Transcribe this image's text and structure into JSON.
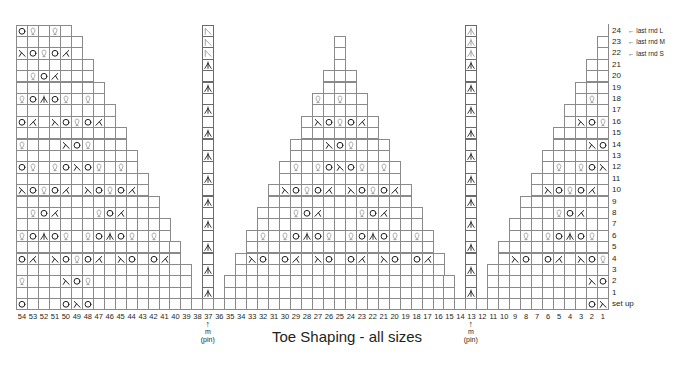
{
  "title": "Toe Shaping - all sizes",
  "colors": {
    "grid": "#8a8a8a",
    "ink": "#231f20",
    "ghost": "#9a9a9a"
  },
  "columns": [
    54,
    53,
    52,
    51,
    50,
    49,
    48,
    47,
    46,
    45,
    44,
    43,
    42,
    41,
    40,
    39,
    38,
    37,
    36,
    35,
    34,
    33,
    32,
    31,
    30,
    29,
    28,
    27,
    26,
    25,
    24,
    23,
    22,
    21,
    20,
    19,
    18,
    17,
    16,
    15,
    14,
    13,
    12,
    11,
    10,
    9,
    8,
    7,
    6,
    5,
    4,
    3,
    2,
    1
  ],
  "rows": [
    "24",
    "23",
    "22",
    "21",
    "20",
    "19",
    "18",
    "17",
    "16",
    "15",
    "14",
    "13",
    "12",
    "11",
    "10",
    "9",
    "8",
    "7",
    "6",
    "5",
    "4",
    "3",
    "2",
    "1",
    "set up"
  ],
  "row_notes": [
    {
      "row": "24",
      "text": "last rnd L"
    },
    {
      "row": "23",
      "text": "last rnd M"
    },
    {
      "row": "22",
      "text": "last rnd S"
    }
  ],
  "markers": [
    {
      "column": 37,
      "symbol": "↑",
      "line1": "m",
      "line2": "(pin)"
    },
    {
      "column": 13,
      "symbol": "↑",
      "line1": "m",
      "line2": "(pin)"
    }
  ],
  "legend_symbols": {
    "O": "yarn-over",
    "Q": "twisted-loop (make one)",
    "L": "left-slanting decrease",
    "R": "right-slanting decrease",
    "A": "centered double decrease",
    "G": "centered double decrease (last round, ghosted)",
    "K": "left-slanting decrease (last round, ghosted)"
  },
  "shape": {
    "24": [
      [
        54,
        50
      ],
      [
        37,
        37
      ],
      [
        13,
        13
      ]
    ],
    "23": [
      [
        54,
        49
      ],
      [
        37,
        37
      ],
      [
        25,
        25
      ],
      [
        13,
        13
      ],
      [
        1,
        1
      ]
    ],
    "22": [
      [
        54,
        49
      ],
      [
        37,
        37
      ],
      [
        25,
        25
      ],
      [
        13,
        13
      ],
      [
        1,
        1
      ]
    ],
    "21": [
      [
        54,
        48
      ],
      [
        37,
        37
      ],
      [
        25,
        25
      ],
      [
        13,
        13
      ],
      [
        2,
        1
      ]
    ],
    "20": [
      [
        54,
        48
      ],
      [
        37,
        37
      ],
      [
        26,
        24
      ],
      [
        13,
        13
      ],
      [
        2,
        1
      ]
    ],
    "19": [
      [
        54,
        47
      ],
      [
        37,
        37
      ],
      [
        26,
        24
      ],
      [
        13,
        13
      ],
      [
        3,
        1
      ]
    ],
    "18": [
      [
        54,
        47
      ],
      [
        37,
        37
      ],
      [
        27,
        23
      ],
      [
        13,
        13
      ],
      [
        3,
        1
      ]
    ],
    "17": [
      [
        54,
        46
      ],
      [
        37,
        37
      ],
      [
        27,
        23
      ],
      [
        13,
        13
      ],
      [
        4,
        1
      ]
    ],
    "16": [
      [
        54,
        46
      ],
      [
        37,
        37
      ],
      [
        28,
        22
      ],
      [
        13,
        13
      ],
      [
        4,
        1
      ]
    ],
    "15": [
      [
        54,
        45
      ],
      [
        37,
        37
      ],
      [
        28,
        22
      ],
      [
        13,
        13
      ],
      [
        5,
        1
      ]
    ],
    "14": [
      [
        54,
        45
      ],
      [
        37,
        37
      ],
      [
        29,
        21
      ],
      [
        13,
        13
      ],
      [
        5,
        1
      ]
    ],
    "13": [
      [
        54,
        44
      ],
      [
        37,
        37
      ],
      [
        29,
        21
      ],
      [
        13,
        13
      ],
      [
        6,
        1
      ]
    ],
    "12": [
      [
        54,
        44
      ],
      [
        37,
        37
      ],
      [
        30,
        20
      ],
      [
        13,
        13
      ],
      [
        6,
        1
      ]
    ],
    "11": [
      [
        54,
        43
      ],
      [
        37,
        37
      ],
      [
        30,
        20
      ],
      [
        13,
        13
      ],
      [
        7,
        1
      ]
    ],
    "10": [
      [
        54,
        43
      ],
      [
        37,
        37
      ],
      [
        31,
        19
      ],
      [
        13,
        13
      ],
      [
        7,
        1
      ]
    ],
    "9": [
      [
        54,
        42
      ],
      [
        37,
        37
      ],
      [
        31,
        19
      ],
      [
        13,
        13
      ],
      [
        8,
        1
      ]
    ],
    "8": [
      [
        54,
        42
      ],
      [
        37,
        37
      ],
      [
        32,
        18
      ],
      [
        13,
        13
      ],
      [
        8,
        1
      ]
    ],
    "7": [
      [
        54,
        41
      ],
      [
        37,
        37
      ],
      [
        32,
        18
      ],
      [
        13,
        13
      ],
      [
        9,
        1
      ]
    ],
    "6": [
      [
        54,
        41
      ],
      [
        37,
        37
      ],
      [
        33,
        17
      ],
      [
        13,
        13
      ],
      [
        9,
        1
      ]
    ],
    "5": [
      [
        54,
        40
      ],
      [
        37,
        37
      ],
      [
        33,
        17
      ],
      [
        13,
        13
      ],
      [
        10,
        1
      ]
    ],
    "4": [
      [
        54,
        40
      ],
      [
        37,
        37
      ],
      [
        34,
        16
      ],
      [
        13,
        13
      ],
      [
        10,
        1
      ]
    ],
    "3": [
      [
        54,
        39
      ],
      [
        37,
        37
      ],
      [
        34,
        16
      ],
      [
        13,
        13
      ],
      [
        11,
        1
      ]
    ],
    "2": [
      [
        54,
        39
      ],
      [
        37,
        37
      ],
      [
        35,
        15
      ],
      [
        13,
        13
      ],
      [
        11,
        1
      ]
    ],
    "1": [
      [
        54,
        39
      ],
      [
        37,
        37
      ],
      [
        35,
        15
      ],
      [
        13,
        13
      ],
      [
        11,
        1
      ]
    ],
    "set up": [
      [
        54,
        1
      ]
    ]
  },
  "symbols": {
    "24": {
      "54": "O",
      "53": "Q",
      "51": "Q",
      "37": "K",
      "13": "G"
    },
    "23": {
      "37": "K",
      "13": "G"
    },
    "22": {
      "54": "R",
      "53": "O",
      "52": "Q",
      "51": "O",
      "50": "L",
      "37": "K",
      "13": "G"
    },
    "21": {
      "37": "A",
      "13": "A"
    },
    "20": {
      "53": "Q",
      "52": "O",
      "51": "L"
    },
    "19": {
      "37": "A",
      "13": "A"
    },
    "18": {
      "54": "Q",
      "53": "O",
      "52": "A",
      "51": "O",
      "50": "Q",
      "48": "Q",
      "27": "Q",
      "25": "Q",
      "2": "Q"
    },
    "17": {
      "37": "A",
      "13": "A"
    },
    "16": {
      "54": "O",
      "53": "L",
      "51": "R",
      "50": "O",
      "49": "Q",
      "48": "O",
      "47": "L",
      "27": "R",
      "26": "O",
      "25": "Q",
      "24": "O",
      "23": "L",
      "3": "R",
      "2": "O",
      "1": "Q"
    },
    "15": {
      "37": "A",
      "13": "A"
    },
    "14": {
      "54": "Q",
      "50": "R",
      "49": "O",
      "48": "Q",
      "26": "R",
      "25": "O",
      "24": "Q",
      "2": "R",
      "1": "O"
    },
    "13": {
      "37": "A",
      "13": "A"
    },
    "12": {
      "54": "O",
      "53": "Q",
      "51": "Q",
      "50": "O",
      "49": "R",
      "48": "O",
      "47": "Q",
      "45": "Q",
      "29": "Q",
      "27": "Q",
      "26": "O",
      "25": "R",
      "24": "O",
      "23": "Q",
      "21": "Q",
      "5": "Q",
      "3": "Q",
      "2": "O",
      "1": "R"
    },
    "11": {
      "37": "A",
      "13": "A"
    },
    "10": {
      "54": "R",
      "53": "O",
      "52": "Q",
      "51": "O",
      "50": "L",
      "48": "R",
      "47": "O",
      "46": "Q",
      "45": "O",
      "44": "L",
      "30": "R",
      "29": "O",
      "28": "Q",
      "27": "O",
      "26": "L",
      "24": "R",
      "23": "O",
      "22": "Q",
      "21": "O",
      "20": "L",
      "6": "R",
      "5": "O",
      "4": "Q",
      "3": "O",
      "2": "L"
    },
    "9": {
      "37": "A",
      "13": "A"
    },
    "8": {
      "53": "Q",
      "52": "O",
      "51": "L",
      "47": "Q",
      "46": "O",
      "45": "L",
      "29": "Q",
      "28": "O",
      "27": "L",
      "23": "Q",
      "22": "O",
      "21": "L",
      "5": "Q",
      "4": "O",
      "3": "L"
    },
    "7": {
      "37": "A",
      "13": "A"
    },
    "6": {
      "54": "Q",
      "53": "O",
      "52": "A",
      "51": "O",
      "50": "Q",
      "48": "Q",
      "47": "O",
      "46": "A",
      "45": "O",
      "44": "Q",
      "42": "Q",
      "32": "Q",
      "30": "Q",
      "29": "O",
      "28": "A",
      "27": "O",
      "26": "Q",
      "24": "Q",
      "23": "O",
      "22": "A",
      "21": "O",
      "20": "Q",
      "18": "Q",
      "8": "Q",
      "6": "Q",
      "5": "O",
      "4": "A",
      "3": "O",
      "2": "Q"
    },
    "5": {
      "37": "A",
      "13": "A"
    },
    "4": {
      "54": "O",
      "53": "L",
      "51": "R",
      "50": "O",
      "49": "Q",
      "48": "O",
      "47": "L",
      "45": "R",
      "44": "O",
      "42": "O",
      "41": "L",
      "33": "R",
      "32": "O",
      "30": "O",
      "29": "L",
      "27": "R",
      "26": "O",
      "24": "O",
      "23": "L",
      "21": "R",
      "20": "O",
      "18": "O",
      "17": "L",
      "9": "R",
      "8": "O",
      "6": "O",
      "5": "L",
      "3": "R",
      "2": "O",
      "1": "Q"
    },
    "3": {
      "37": "A",
      "13": "A"
    },
    "2": {
      "54": "Q",
      "50": "R",
      "49": "O",
      "48": "Q",
      "2": "R",
      "1": "O"
    },
    "1": {
      "37": "A",
      "13": "A"
    },
    "set up": {
      "54": "O",
      "50": "O",
      "49": "R",
      "48": "O",
      "2": "O",
      "1": "R"
    }
  }
}
